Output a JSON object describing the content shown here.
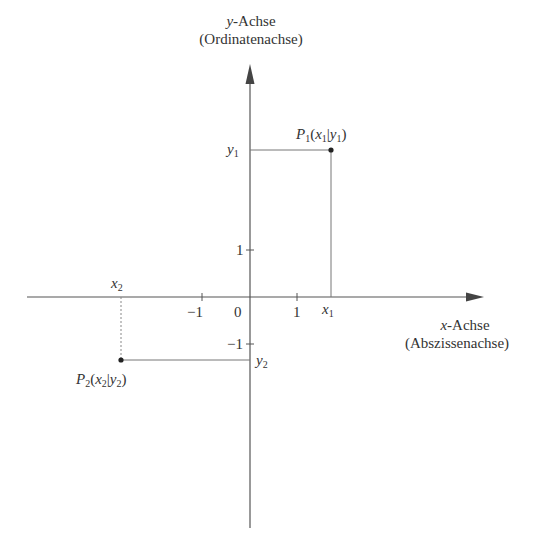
{
  "diagram": {
    "y_axis": {
      "label_var": "y",
      "label_suffix": "-Achse",
      "label_alt": "(Ordinatenachse)"
    },
    "x_axis": {
      "label_var": "x",
      "label_suffix": "-Achse",
      "label_alt": "(Abszissenachse)"
    },
    "ticks": {
      "origin": "0",
      "x_pos": "1",
      "x_neg": "−1",
      "y_pos": "1",
      "y_neg": "−1"
    },
    "points": [
      {
        "name": "P",
        "sub": "1",
        "x_var": "x",
        "x_sub": "1",
        "y_var": "y",
        "y_sub": "1",
        "x": 1.7,
        "y": 3.1
      },
      {
        "name": "P",
        "sub": "2",
        "x_var": "x",
        "x_sub": "2",
        "y_var": "y",
        "y_sub": "2",
        "x": -2.7,
        "y": -1.3
      }
    ],
    "colors": {
      "axis": "#555555",
      "guide": "#777777",
      "point": "#222222",
      "text": "#333333"
    }
  }
}
